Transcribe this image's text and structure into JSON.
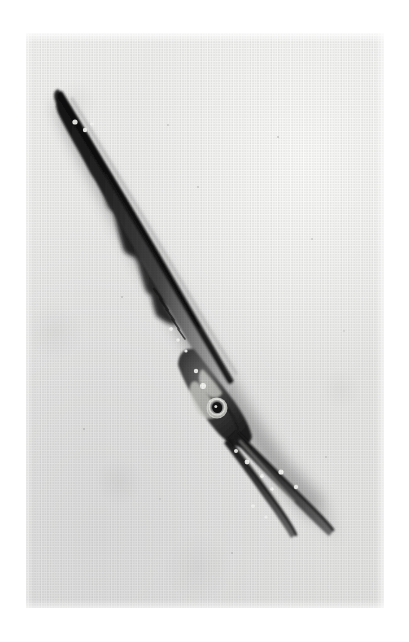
{
  "image": {
    "kind": "scanned-halftone-photograph",
    "subject": "needlefish specimen (Belonidae / garfish), whole body, dorsal-lateral view",
    "orientation": "diagonal, tail at upper-left, elongated beak at lower-right",
    "background_description": "plain pale grey photographic paper with visible scan banding and halftone dot screen",
    "canvas": {
      "width": 409,
      "height": 642,
      "background_color": "#ffffff"
    },
    "plate": {
      "left": 26,
      "top": 33,
      "width": 358,
      "height": 575,
      "paper_color": "#ececeb",
      "paper_highlight_color": "#fbfbfa",
      "paper_shadow_color": "#dcdcdc"
    },
    "palette": {
      "body_darkest": "#1c1c1c",
      "body_dark": "#2e2e2e",
      "body_mid": "#4d4d4d",
      "body_light": "#8e8e8e",
      "belly_light": "#c9c9c9",
      "specular_white": "#f8f8f6",
      "eye_pupil": "#141414",
      "eye_ring": "#e8e8e4",
      "shadow_cast": "#bdbdbd"
    },
    "anatomy": {
      "tail_tip": {
        "x": 60,
        "y": 98,
        "label": "caudal-fin tip"
      },
      "caudal_peduncle": {
        "x": 96,
        "y": 170
      },
      "dorsal_fin": {
        "x": 118,
        "y": 210,
        "label": "dorsal fin, dark ragged rays"
      },
      "anal_fin": {
        "x": 140,
        "y": 250,
        "label": "anal fin"
      },
      "mid_body": {
        "x": 165,
        "y": 320
      },
      "operculum": {
        "x": 200,
        "y": 385,
        "label": "gill cover"
      },
      "eye": {
        "x": 217,
        "y": 408,
        "radius": 9,
        "label": "eye with dark pupil and pale ring"
      },
      "jaw_hinge": {
        "x": 232,
        "y": 432
      },
      "upper_jaw_tip": {
        "x": 333,
        "y": 532,
        "label": "upper beak tip"
      },
      "lower_jaw_tip": {
        "x": 292,
        "y": 546,
        "label": "lower beak tip"
      },
      "body_axis_degrees": 52
    },
    "highlights": [
      {
        "x": 75,
        "y": 122,
        "r": 2.6
      },
      {
        "x": 85,
        "y": 130,
        "r": 2.2
      },
      {
        "x": 92,
        "y": 124,
        "r": 1.8
      },
      {
        "x": 171,
        "y": 329,
        "r": 2.0
      },
      {
        "x": 178,
        "y": 340,
        "r": 1.7
      },
      {
        "x": 186,
        "y": 351,
        "r": 1.6
      },
      {
        "x": 196,
        "y": 371,
        "r": 2.2
      },
      {
        "x": 203,
        "y": 386,
        "r": 3.0
      },
      {
        "x": 236,
        "y": 451,
        "r": 2.0
      },
      {
        "x": 247,
        "y": 462,
        "r": 2.4
      },
      {
        "x": 262,
        "y": 476,
        "r": 2.0
      },
      {
        "x": 272,
        "y": 489,
        "r": 1.8
      },
      {
        "x": 281,
        "y": 472,
        "r": 2.6
      },
      {
        "x": 296,
        "y": 487,
        "r": 2.2
      },
      {
        "x": 253,
        "y": 506,
        "r": 1.8
      },
      {
        "x": 266,
        "y": 517,
        "r": 1.6
      }
    ]
  }
}
